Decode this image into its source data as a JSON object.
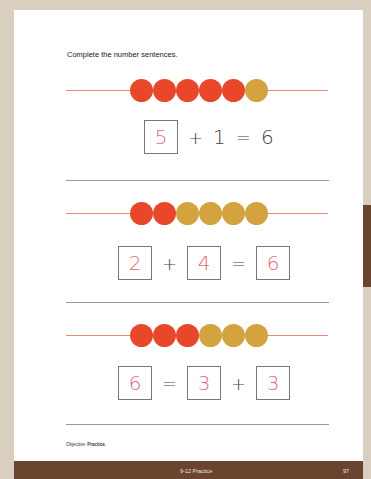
{
  "instruction": "Complete the number sentences.",
  "colors": {
    "red_bead": "#e8472a",
    "gold_bead": "#d2a33e",
    "answer_ink": "#e06a7a",
    "footer_bar": "#6b4430"
  },
  "problems": [
    {
      "beads": [
        "red",
        "red",
        "red",
        "red",
        "red",
        "gold"
      ],
      "sentence": {
        "a": "5",
        "op1": "+",
        "b": "1",
        "op2": "=",
        "c": "6"
      }
    },
    {
      "beads": [
        "red",
        "red",
        "gold",
        "gold",
        "gold",
        "gold"
      ],
      "sentence": {
        "a": "2",
        "op1": "+",
        "b": "4",
        "op2": "=",
        "c": "6"
      }
    },
    {
      "beads": [
        "red",
        "red",
        "red",
        "gold",
        "gold",
        "gold"
      ],
      "sentence": {
        "a": "6",
        "op1": "=",
        "b": "3",
        "op2": "+",
        "c": "3"
      }
    }
  ],
  "objective": {
    "label": "Objective:",
    "text": "Practice."
  },
  "footer": {
    "section": "9-12 Practice",
    "page_number": "97"
  }
}
